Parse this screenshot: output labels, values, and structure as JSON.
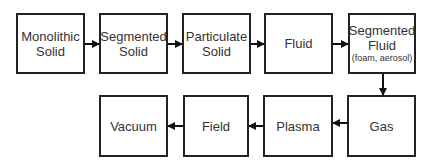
{
  "diagram": {
    "nodes": [
      {
        "id": "monolithic-solid",
        "lines": [
          "Monolithic",
          "Solid"
        ],
        "sub": ""
      },
      {
        "id": "segmented-solid",
        "lines": [
          "Segmented",
          "Solid"
        ],
        "sub": ""
      },
      {
        "id": "particulate-solid",
        "lines": [
          "Particulate",
          "Solid"
        ],
        "sub": ""
      },
      {
        "id": "fluid",
        "lines": [
          "Fluid",
          ""
        ],
        "sub": ""
      },
      {
        "id": "segmented-fluid",
        "lines": [
          "Segmented",
          "Fluid"
        ],
        "sub": "(foam, aerosol)"
      },
      {
        "id": "gas",
        "lines": [
          "Gas",
          ""
        ],
        "sub": ""
      },
      {
        "id": "plasma",
        "lines": [
          "Plasma",
          ""
        ],
        "sub": ""
      },
      {
        "id": "field",
        "lines": [
          "Field",
          ""
        ],
        "sub": ""
      },
      {
        "id": "vacuum",
        "lines": [
          "Vacuum",
          ""
        ],
        "sub": ""
      }
    ],
    "edges": [
      {
        "from": "monolithic-solid",
        "to": "segmented-solid"
      },
      {
        "from": "segmented-solid",
        "to": "particulate-solid"
      },
      {
        "from": "particulate-solid",
        "to": "fluid"
      },
      {
        "from": "fluid",
        "to": "segmented-fluid"
      },
      {
        "from": "segmented-fluid",
        "to": "gas"
      },
      {
        "from": "gas",
        "to": "plasma"
      },
      {
        "from": "plasma",
        "to": "field"
      },
      {
        "from": "field",
        "to": "vacuum"
      }
    ]
  }
}
